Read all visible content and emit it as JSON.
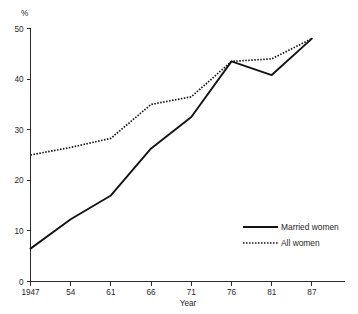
{
  "chart_data": {
    "type": "line",
    "title": "",
    "xlabel": "Year",
    "ylabel": "",
    "unit_label": "%",
    "categories": [
      "1947",
      "54",
      "61",
      "66",
      "71",
      "76",
      "81",
      "87"
    ],
    "x_tick_labels": [
      "1947",
      "54",
      "61",
      "66",
      "71",
      "76",
      "81",
      "87"
    ],
    "y_tick_labels": [
      "0",
      "10",
      "20",
      "30",
      "40",
      "50"
    ],
    "y_ticks": [
      0,
      10,
      20,
      30,
      40,
      50
    ],
    "ylim": [
      0,
      50
    ],
    "grid": false,
    "legend_position": "bottom-right",
    "series": [
      {
        "name": "Married women",
        "style": "solid",
        "color": "#141414",
        "values": [
          6.5,
          12.3,
          17.0,
          26.3,
          32.5,
          43.5,
          40.8,
          48.0
        ]
      },
      {
        "name": "All women",
        "style": "dotted",
        "color": "#141414",
        "values": [
          25.0,
          26.5,
          28.3,
          35.0,
          36.5,
          43.5,
          44.0,
          48.0
        ]
      }
    ]
  },
  "legend": {
    "items": [
      {
        "label": "Married women",
        "style": "solid"
      },
      {
        "label": "All women",
        "style": "dotted"
      }
    ]
  },
  "colors": {
    "ink": "#141414",
    "axis": "#2b2b2b",
    "background": "#ffffff"
  }
}
